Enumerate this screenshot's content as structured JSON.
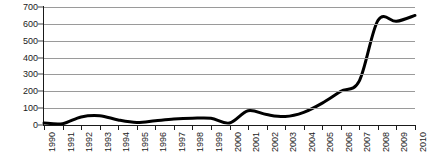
{
  "chart_data": {
    "type": "line",
    "title": "",
    "subtitle": "",
    "xlabel": "",
    "ylabel": "",
    "ylim": [
      0,
      700
    ],
    "ytick_step": 100,
    "yticks": [
      0,
      100,
      200,
      300,
      400,
      500,
      600,
      700
    ],
    "ytick_labels": [
      "0",
      "100",
      "200",
      "300",
      "400",
      "500",
      "600",
      "700"
    ],
    "grid": true,
    "grid_orientation": "horizontal",
    "legend": false,
    "legend_position": "none",
    "xlabel_rotation": -90,
    "categories": [
      "1990",
      "1991",
      "1992",
      "1993",
      "1994",
      "1995",
      "1996",
      "1997",
      "1998",
      "1999",
      "2000",
      "2001",
      "2002",
      "2003",
      "2004",
      "2005",
      "2006",
      "2007",
      "2008",
      "2009",
      "2010"
    ],
    "x": [
      1990,
      1991,
      1992,
      1993,
      1994,
      1995,
      1996,
      1997,
      1998,
      1999,
      2000,
      2001,
      2002,
      2003,
      2004,
      2005,
      2006,
      2007,
      2008,
      2009,
      2010
    ],
    "values": [
      12,
      8,
      48,
      55,
      30,
      15,
      25,
      35,
      40,
      40,
      12,
      85,
      62,
      50,
      75,
      130,
      200,
      262,
      620,
      615,
      650
    ],
    "series": [
      {
        "name": "series-1",
        "color": "#000000",
        "line_width": 3,
        "values": [
          12,
          8,
          48,
          55,
          30,
          15,
          25,
          35,
          40,
          40,
          12,
          85,
          62,
          50,
          75,
          130,
          200,
          262,
          620,
          615,
          650
        ]
      }
    ],
    "colors": {
      "line": "#000000",
      "grid": "#9a9a9a",
      "axis": "#1a1a1a",
      "background": "#ffffff",
      "text": "#1a1a1a"
    }
  }
}
